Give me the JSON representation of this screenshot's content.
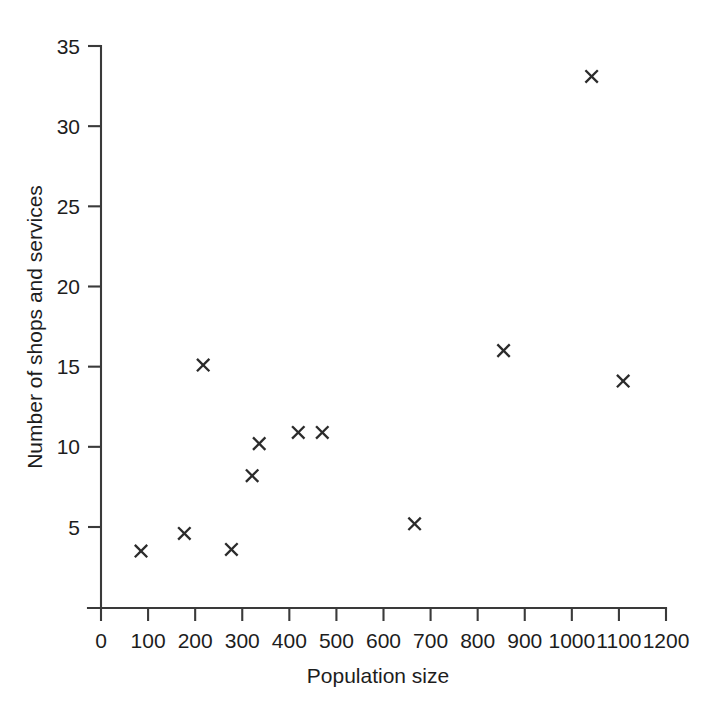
{
  "chart_data": {
    "type": "scatter",
    "title": "",
    "xlabel": "Population size",
    "ylabel": "Number of shops and services",
    "xlim": [
      0,
      1200
    ],
    "ylim": [
      0,
      35
    ],
    "xticks": [
      0,
      100,
      200,
      300,
      400,
      500,
      600,
      700,
      800,
      900,
      1000,
      1100,
      1200
    ],
    "yticks": [
      5,
      10,
      15,
      20,
      25,
      30,
      35
    ],
    "grid": false,
    "legend": null,
    "marker": "x",
    "marker_color": "#2b2b2b",
    "axis_color": "#3a3a3a",
    "background": "#ffffff",
    "points": [
      {
        "x": 85,
        "y": 3.5
      },
      {
        "x": 177,
        "y": 4.6
      },
      {
        "x": 217,
        "y": 15.1
      },
      {
        "x": 277,
        "y": 3.6
      },
      {
        "x": 321,
        "y": 8.2
      },
      {
        "x": 336,
        "y": 10.2
      },
      {
        "x": 419,
        "y": 10.9
      },
      {
        "x": 470,
        "y": 10.9
      },
      {
        "x": 666,
        "y": 5.2
      },
      {
        "x": 855,
        "y": 16.0
      },
      {
        "x": 1042,
        "y": 33.1
      },
      {
        "x": 1109,
        "y": 14.1
      }
    ]
  }
}
